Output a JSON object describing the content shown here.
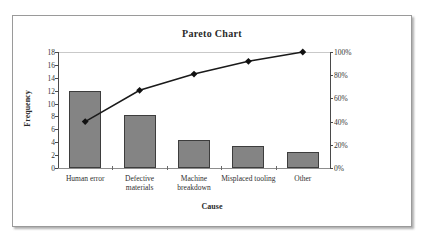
{
  "chart_data": {
    "type": "bar",
    "title": "Pareto Chart",
    "xlabel": "Cause",
    "ylabel": "Frequency",
    "y2label": "",
    "categories": [
      "Human error",
      "Defective materials",
      "Machine breakdown",
      "Misplaced tooling",
      "Other"
    ],
    "category_lines": [
      [
        "Human error"
      ],
      [
        "Defective",
        "materials"
      ],
      [
        "Machine",
        "breakdown"
      ],
      [
        "Misplaced tooling"
      ],
      [
        "Other"
      ]
    ],
    "series": [
      {
        "name": "Frequency",
        "type": "bar",
        "axis": "left",
        "values": [
          12,
          8.2,
          4.3,
          3.4,
          2.5
        ]
      },
      {
        "name": "Cumulative Percentage",
        "type": "line",
        "axis": "right",
        "values": [
          40,
          67,
          81,
          92,
          100
        ]
      }
    ],
    "ylim": [
      0,
      18
    ],
    "yticks": [
      0,
      2,
      4,
      6,
      8,
      10,
      12,
      14,
      16,
      18
    ],
    "ytick_labels": [
      "0",
      "2",
      "4",
      "6",
      "8",
      "10",
      "12",
      "14",
      "16",
      "18"
    ],
    "y2lim": [
      0,
      100
    ],
    "y2ticks": [
      0,
      20,
      40,
      60,
      80,
      100
    ],
    "y2tick_labels": [
      "0%",
      "20%",
      "40%",
      "60%",
      "80%",
      "100%"
    ],
    "grid": true,
    "gridlines_at": [
      18
    ],
    "legend": null,
    "colors": {
      "bar_fill": "#848484",
      "bar_border": "#3d3d3d",
      "line": "#1a1a1a",
      "marker": "#111111",
      "axis": "#4a4a4a",
      "grid": "#c9c9c9",
      "frame_border": "#9a9a9a",
      "text": "#2a2a2a",
      "background": "#ffffff"
    }
  }
}
